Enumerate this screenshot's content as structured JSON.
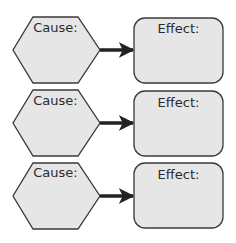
{
  "diagram": {
    "title": "",
    "colors": {
      "fill": "#e6e6e6",
      "stroke": "#3a3a3a",
      "arrow": "#222222",
      "background": "#ffffff"
    },
    "rows": [
      {
        "cause_label": "Cause:",
        "effect_label": "Effect:",
        "cause_text": "",
        "effect_text": ""
      },
      {
        "cause_label": "Cause:",
        "effect_label": "Effect:",
        "cause_text": "",
        "effect_text": ""
      },
      {
        "cause_label": "Cause:",
        "effect_label": "Effect:",
        "cause_text": "",
        "effect_text": ""
      }
    ]
  }
}
